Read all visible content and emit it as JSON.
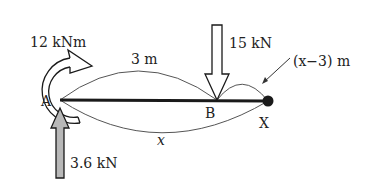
{
  "diagram": {
    "type": "beam free-body diagram",
    "colors": {
      "ink": "#1a1a1a",
      "reaction_fill": "#b8b8b8",
      "background": "#ffffff"
    },
    "points": {
      "A": "A",
      "B": "B",
      "X": "X"
    },
    "loads": {
      "moment": "12 kNm",
      "point_load": "15 kN",
      "reaction": "3.6 kN"
    },
    "dimensions": {
      "AB": "3 m",
      "BX": "(x−3) m",
      "AX": "x"
    }
  }
}
